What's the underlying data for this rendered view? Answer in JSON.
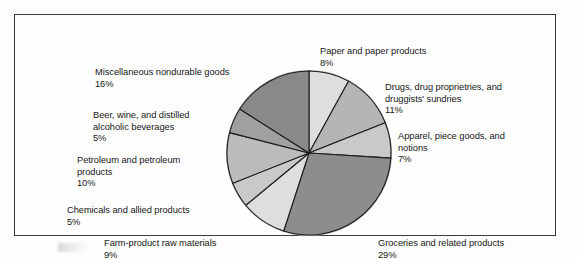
{
  "figure": {
    "frame_color": "#3a3a3a",
    "background": "#fefefe"
  },
  "chart_data": {
    "type": "pie",
    "title": "",
    "subtitle": "",
    "xlabel": "",
    "ylabel": "",
    "legend_position": "callout-labels",
    "grid": false,
    "units": "percent",
    "total": 100,
    "start_angle_deg": 0,
    "direction": "clockwise",
    "categories": [
      "Paper and paper products",
      "Drugs, drug proprietries, and druggists' sundries",
      "Apparel, piece goods, and notions",
      "Groceries and related products",
      "Farm-product raw materials",
      "Chemicals and allied products",
      "Petroleum and petroleum products",
      "Beer, wine, and distilled alcoholic beverages",
      "Miscellaneous nondurable goods"
    ],
    "values": [
      8,
      11,
      7,
      29,
      9,
      5,
      10,
      5,
      16
    ],
    "slice_colors": [
      "#dedede",
      "#b5b5b5",
      "#c9c9c9",
      "#8d8d8d",
      "#dedede",
      "#c9c9c9",
      "#bcbcbc",
      "#a0a0a0",
      "#898989"
    ],
    "slice_edge_color": "#1d1d1d",
    "slices": [
      {
        "label": "Paper and paper products",
        "value_label": "8%",
        "value": 8,
        "color": "#dedede"
      },
      {
        "label": "Drugs, drug proprietries, and\ndruggists' sundries",
        "value_label": "11%",
        "value": 11,
        "color": "#b5b5b5"
      },
      {
        "label": "Apparel, piece goods, and\nnotions",
        "value_label": "7%",
        "value": 7,
        "color": "#c9c9c9"
      },
      {
        "label": "Groceries and related products",
        "value_label": "29%",
        "value": 29,
        "color": "#8d8d8d"
      },
      {
        "label": "Farm-product raw materials",
        "value_label": "9%",
        "value": 9,
        "color": "#dedede"
      },
      {
        "label": "Chemicals and allied products",
        "value_label": "5%",
        "value": 5,
        "color": "#c9c9c9"
      },
      {
        "label": "Petroleum and petroleum\nproducts",
        "value_label": "10%",
        "value": 10,
        "color": "#bcbcbc"
      },
      {
        "label": "Beer, wine, and distilled\nalcoholic beverages",
        "value_label": "5%",
        "value": 5,
        "color": "#a0a0a0"
      },
      {
        "label": "Miscellaneous nondurable goods",
        "value_label": "16%",
        "value": 16,
        "color": "#898989"
      }
    ]
  }
}
